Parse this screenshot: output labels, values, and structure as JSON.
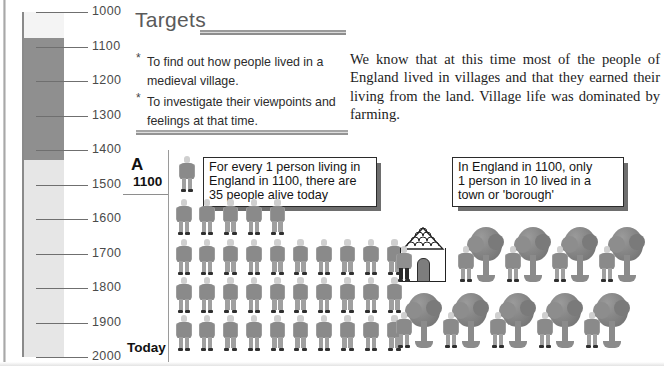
{
  "timeline": {
    "ticks": [
      {
        "label": "1000",
        "y": 0
      },
      {
        "label": "1100",
        "y": 34.5
      },
      {
        "label": "1200",
        "y": 69
      },
      {
        "label": "1300",
        "y": 103.5
      },
      {
        "label": "1400",
        "y": 138
      },
      {
        "label": "1500",
        "y": 172.5
      },
      {
        "label": "1600",
        "y": 207
      },
      {
        "label": "1700",
        "y": 241.5
      },
      {
        "label": "1800",
        "y": 276
      },
      {
        "label": "1900",
        "y": 310.5
      },
      {
        "label": "2000",
        "y": 345
      }
    ],
    "highlight_period": {
      "from": "1080",
      "to": "1450",
      "color": "#8f8f8f"
    },
    "bar_color": "#e6e6e6"
  },
  "targets": {
    "heading": "Targets",
    "bullet": "*",
    "items": [
      "To find out how people lived in a medieval village.",
      "To investigate their viewpoints and feelings at that time."
    ]
  },
  "intro": {
    "paragraph": "We know that at this time most of the people of England lived in villages and that they earned their living from the land.  Village life was dominated by farming."
  },
  "activity": {
    "letter": "A",
    "year_label": "1100",
    "today_label": "Today"
  },
  "callouts": [
    {
      "id": "callout-people",
      "lines": [
        "For every 1 person living in",
        "England in 1100, there are",
        "35 people alive today"
      ]
    },
    {
      "id": "callout-town",
      "lines": [
        "In England in 1100, only",
        "1 person in 10 lived in a",
        "town or 'borough'"
      ]
    }
  ],
  "chart_data": {
    "type": "pictogram",
    "series": [
      {
        "name": "1100",
        "symbol": "person-figure",
        "count": 1,
        "rows": [
          1
        ]
      },
      {
        "name": "Today",
        "symbol": "person-figure",
        "count": 35,
        "rows": [
          5,
          10,
          10,
          10
        ]
      }
    ],
    "symbol_value": 1,
    "unit": "person",
    "note": "For every 1 person living in England in 1100, there are 35 people alive today"
  },
  "village_chart": {
    "type": "pictogram",
    "title": "Where people lived in England in 1100",
    "categories": [
      "town or 'borough'",
      "village / countryside"
    ],
    "values": [
      1,
      9
    ],
    "symbols": [
      "house-with-person",
      "tree-with-person"
    ],
    "total": 10,
    "rows": [
      5,
      5
    ],
    "note": "In England in 1100, only 1 person in 10 lived in a town or 'borough'"
  },
  "colors": {
    "figure_body": "#8a8a8a",
    "figure_head": "#cfcfcf",
    "figure_feet": "#2f2f2f",
    "tree": "#7e7e7e",
    "timeline_dark": "#8f8f8f",
    "timeline_light": "#e6e6e6",
    "rule": "#9a9a9a",
    "text": "#1d1d1d"
  }
}
